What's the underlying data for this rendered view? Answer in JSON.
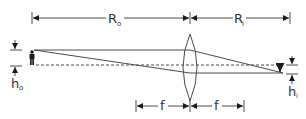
{
  "diagram": {
    "type": "thin-lens-ray-diagram",
    "colors": {
      "line": "#4a4a4a",
      "arrow": "#1a1a1a",
      "background": "#ffffff"
    },
    "labels": {
      "object_distance": {
        "main": "R",
        "sub": "o"
      },
      "image_distance": {
        "main": "R",
        "sub": "i"
      },
      "object_height": {
        "main": "h",
        "sub": "o"
      },
      "image_height": {
        "main": "h",
        "sub": "i"
      },
      "focal_left": "f",
      "focal_right": "f"
    },
    "elements": {
      "object": "person-icon",
      "lens": "convex-lens",
      "optical_axis": "dashed-line",
      "rays": [
        "parallel-ray-through-focus",
        "ray-through-center"
      ]
    }
  }
}
